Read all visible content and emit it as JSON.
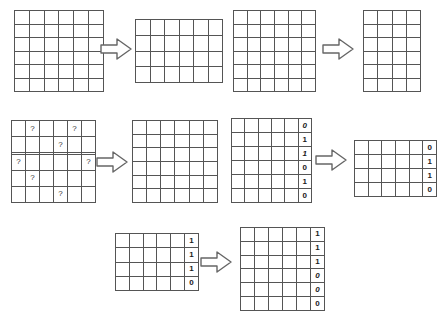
{
  "diagram": {
    "arrow_icon": "right-block-arrow-icon",
    "question_mark": "?",
    "empty_cell": "",
    "stroke_color": "#555555",
    "arrow_stroke_color": "#666666",
    "background_color": "#ffffff",
    "rows": [
      {
        "name": "row-1",
        "source": {
          "name": "grid-source-1",
          "cols": 6,
          "rows": 6,
          "cells": [
            [
              "",
              "",
              "",
              "",
              "",
              ""
            ],
            [
              "",
              "",
              "",
              "",
              "",
              ""
            ],
            [
              "",
              "",
              "",
              "",
              "",
              ""
            ],
            [
              "",
              "",
              "",
              "",
              "",
              ""
            ],
            [
              "",
              "",
              "",
              "",
              "",
              ""
            ],
            [
              "",
              "",
              "",
              "",
              "",
              ""
            ]
          ]
        },
        "target": {
          "name": "grid-target-1",
          "cols": 6,
          "rows": 4,
          "cells": [
            [
              "",
              "",
              "",
              "",
              "",
              ""
            ],
            [
              "",
              "",
              "",
              "",
              "",
              ""
            ],
            [
              "",
              "",
              "",
              "",
              "",
              ""
            ],
            [
              "",
              "",
              "",
              "",
              "",
              ""
            ]
          ]
        }
      },
      {
        "name": "row-2",
        "source": {
          "name": "grid-source-2",
          "cols": 6,
          "rows": 6,
          "cells": [
            [
              "",
              "",
              "",
              "",
              "",
              ""
            ],
            [
              "",
              "",
              "",
              "",
              "",
              ""
            ],
            [
              "",
              "",
              "",
              "",
              "",
              ""
            ],
            [
              "",
              "",
              "",
              "",
              "",
              ""
            ],
            [
              "",
              "",
              "",
              "",
              "",
              ""
            ],
            [
              "",
              "",
              "",
              "",
              "",
              ""
            ]
          ]
        },
        "target": {
          "name": "grid-target-2",
          "cols": 4,
          "rows": 6,
          "cells": [
            [
              "",
              "",
              "",
              ""
            ],
            [
              "",
              "",
              "",
              ""
            ],
            [
              "",
              "",
              "",
              ""
            ],
            [
              "",
              "",
              "",
              ""
            ],
            [
              "",
              "",
              "",
              ""
            ],
            [
              "",
              "",
              "",
              ""
            ]
          ]
        }
      },
      {
        "name": "row-3",
        "source": {
          "name": "grid-source-3-questions",
          "cols": 6,
          "rows": 6,
          "cells": [
            [
              "",
              "?",
              "",
              "",
              "?",
              ""
            ],
            [
              "",
              "",
              "",
              "?",
              "",
              ""
            ],
            [
              "",
              "",
              "",
              "",
              "",
              ""
            ],
            [
              "?",
              "",
              "",
              "",
              "",
              "?"
            ],
            [
              "",
              "?",
              "",
              "",
              "",
              ""
            ],
            [
              "",
              "",
              "",
              "?",
              "",
              ""
            ]
          ]
        },
        "target": {
          "name": "grid-target-3",
          "cols": 6,
          "rows": 6,
          "cells": [
            [
              "",
              "",
              "",
              "",
              "",
              ""
            ],
            [
              "",
              "",
              "",
              "",
              "",
              ""
            ],
            [
              "",
              "",
              "",
              "",
              "",
              ""
            ],
            [
              "",
              "",
              "",
              "",
              "",
              ""
            ],
            [
              "",
              "",
              "",
              "",
              "",
              ""
            ],
            [
              "",
              "",
              "",
              "",
              "",
              ""
            ]
          ]
        }
      },
      {
        "name": "row-4",
        "source": {
          "name": "grid-source-4-bits",
          "cols": 6,
          "rows": 6,
          "cells": [
            [
              "",
              "",
              "",
              "",
              "",
              "0"
            ],
            [
              "",
              "",
              "",
              "",
              "",
              "1"
            ],
            [
              "",
              "",
              "",
              "",
              "",
              "1"
            ],
            [
              "",
              "",
              "",
              "",
              "",
              "0"
            ],
            [
              "",
              "",
              "",
              "",
              "",
              "1"
            ],
            [
              "",
              "",
              "",
              "",
              "",
              "0"
            ]
          ],
          "struck_rows": [
            1,
            3
          ]
        },
        "target": {
          "name": "grid-target-4-bits",
          "cols": 6,
          "rows": 4,
          "cells": [
            [
              "",
              "",
              "",
              "",
              "",
              "0"
            ],
            [
              "",
              "",
              "",
              "",
              "",
              "1"
            ],
            [
              "",
              "",
              "",
              "",
              "",
              "1"
            ],
            [
              "",
              "",
              "",
              "",
              "",
              "0"
            ]
          ],
          "struck_rows": []
        }
      },
      {
        "name": "row-5",
        "source": {
          "name": "grid-source-5-bits",
          "cols": 6,
          "rows": 4,
          "cells": [
            [
              "",
              "",
              "",
              "",
              "",
              "1"
            ],
            [
              "",
              "",
              "",
              "",
              "",
              "1"
            ],
            [
              "",
              "",
              "",
              "",
              "",
              "1"
            ],
            [
              "",
              "",
              "",
              "",
              "",
              "0"
            ]
          ],
          "struck_rows": []
        },
        "target": {
          "name": "grid-target-5-bits",
          "cols": 6,
          "rows": 6,
          "cells": [
            [
              "",
              "",
              "",
              "",
              "",
              "1"
            ],
            [
              "",
              "",
              "",
              "",
              "",
              "1"
            ],
            [
              "",
              "",
              "",
              "",
              "",
              "1"
            ],
            [
              "",
              "",
              "",
              "",
              "",
              "0"
            ],
            [
              "",
              "",
              "",
              "",
              "",
              "0"
            ],
            [
              "",
              "",
              "",
              "",
              "",
              "0"
            ]
          ],
          "struck_rows": [
            4,
            5
          ]
        }
      }
    ]
  }
}
